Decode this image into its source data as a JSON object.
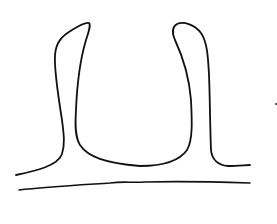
{
  "diagram": {
    "type": "line-drawing",
    "stroke_color": "#111111",
    "background_color": "#ffffff",
    "elements": [
      {
        "id": "u-outline",
        "kind": "path",
        "d": "M16,175 C35,171 58,166 62,154 C65,145 64,135 62,120 C58,95 54,70 55,55 C56,42 62,36 72,30 C80,25 86,22 89,23 C91,25 89,31 86,40 C80,60 77,85 76,110 C75,125 75,137 80,145 C88,157 105,163 140,166 C165,166 180,160 187,150 C193,140 192,120 191,100 C189,75 182,55 175,40 C172,33 172,27 177,24 C184,21 195,25 201,33 C207,42 208,55 209,75 C210,100 210,125 211,150 C212,160 218,165 228,166 C238,166 246,165 250,165",
        "stroke_width": 1.8
      },
      {
        "id": "ground-line",
        "kind": "path",
        "d": "M19,190 C45,187 80,185 110,183 C125,181 130,183 145,182 C180,181 220,182 250,183",
        "stroke_width": 1.6
      },
      {
        "id": "stray-dot",
        "kind": "dot",
        "cx": 276,
        "cy": 104,
        "r": 0.9
      }
    ]
  }
}
